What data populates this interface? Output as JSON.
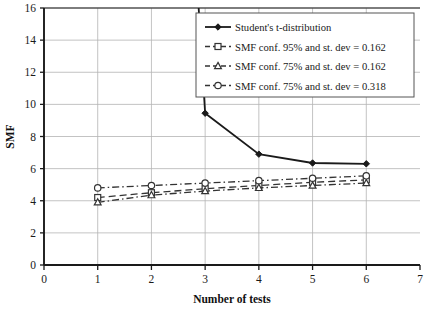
{
  "chart_data": {
    "type": "line",
    "title": "",
    "xlabel": "Number of tests",
    "ylabel": "SMF",
    "xlim": [
      0,
      7
    ],
    "ylim": [
      0,
      16
    ],
    "xticks": [
      0,
      1,
      2,
      3,
      4,
      5,
      6,
      7
    ],
    "yticks": [
      0,
      2,
      4,
      6,
      8,
      10,
      12,
      14,
      16
    ],
    "grid": true,
    "legend_position": "top-right",
    "x": [
      1,
      2,
      3,
      4,
      5,
      6
    ],
    "series": [
      {
        "name": "Student's t-distribution",
        "values": [
          null,
          63.7,
          9.45,
          6.9,
          6.35,
          6.3
        ],
        "marker": "diamond",
        "linestyle": "solid",
        "color": "#1a1a1a",
        "clipped_above_ylim": true
      },
      {
        "name": "SMF conf. 95% and st. dev = 0.162",
        "values": [
          4.2,
          4.5,
          4.75,
          4.95,
          5.15,
          5.3
        ],
        "marker": "square",
        "linestyle": "dashed",
        "color": "#333333"
      },
      {
        "name": "SMF conf. 75% and st. dev = 0.162",
        "values": [
          3.9,
          4.35,
          4.6,
          4.8,
          4.95,
          5.1
        ],
        "marker": "triangle",
        "linestyle": "dashdot",
        "color": "#333333"
      },
      {
        "name": "SMF conf. 75% and st. dev = 0.318",
        "values": [
          4.8,
          4.95,
          5.1,
          5.25,
          5.4,
          5.55
        ],
        "marker": "circle",
        "linestyle": "dashdot",
        "color": "#333333"
      }
    ]
  },
  "axes": {
    "y_title": "SMF",
    "x_title": "Number of tests",
    "x_tick_labels": [
      "0",
      "1",
      "2",
      "3",
      "4",
      "5",
      "6",
      "7"
    ],
    "y_tick_labels": [
      "0",
      "2",
      "4",
      "6",
      "8",
      "10",
      "12",
      "14",
      "16"
    ]
  },
  "legend": {
    "entries": [
      {
        "label": "Student's t-distribution"
      },
      {
        "label": "SMF conf. 95% and st. dev = 0.162"
      },
      {
        "label": "SMF conf. 75% and st. dev = 0.162"
      },
      {
        "label": "SMF conf. 75% and st. dev = 0.318"
      }
    ]
  },
  "style": {
    "plot_background": "#ffffff",
    "grid_color": "#b4b4b4",
    "axis_color": "#1a1a1a",
    "series_color": "#333333"
  }
}
